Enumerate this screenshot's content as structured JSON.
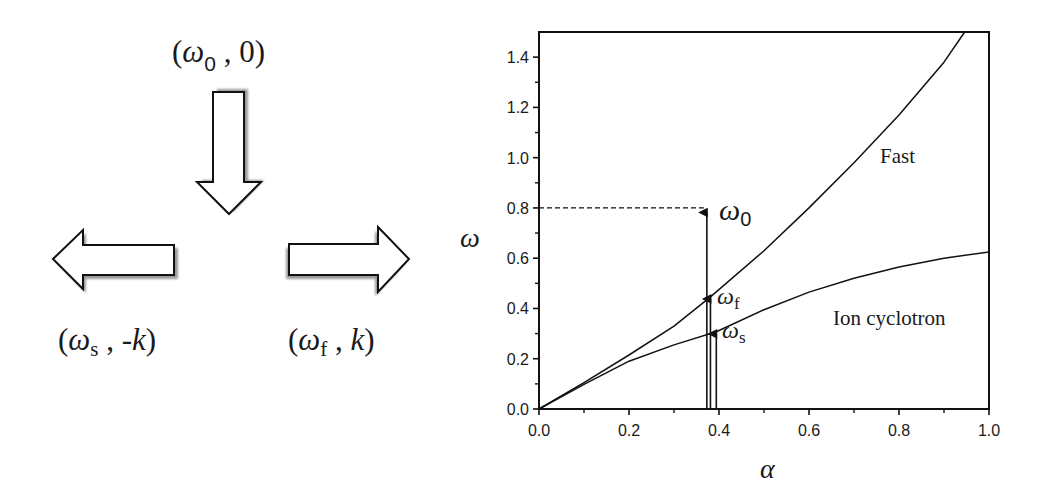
{
  "left_panel": {
    "top_label": {
      "open": "(",
      "omega": "ω",
      "sub": "0",
      "rest": " , 0)"
    },
    "left_label": {
      "open": "(",
      "omega": "ω",
      "sub": "s",
      "sep": " , -",
      "k": "k",
      "close": ")"
    },
    "right_label": {
      "open": "(",
      "omega": "ω",
      "sub": "f",
      "sep": " , ",
      "k": "k",
      "close": ")"
    },
    "arrows": [
      {
        "name": "incident-wave-arrow",
        "direction": "down"
      },
      {
        "name": "slow-wave-arrow",
        "direction": "left"
      },
      {
        "name": "fast-wave-arrow",
        "direction": "right"
      }
    ]
  },
  "chart_data": {
    "type": "line",
    "title": "",
    "xlabel": "α",
    "ylabel": "ω",
    "xlim": [
      0.0,
      1.0
    ],
    "ylim": [
      0.0,
      1.5
    ],
    "grid": false,
    "x_ticks": [
      "0.0",
      "0.2",
      "0.4",
      "0.6",
      "0.8",
      "1.0"
    ],
    "y_ticks": [
      "0.0",
      "0.2",
      "0.4",
      "0.6",
      "0.8",
      "1.0",
      "1.2",
      "1.4"
    ],
    "series": [
      {
        "name": "Fast",
        "x": [
          0.0,
          0.1,
          0.2,
          0.3,
          0.381,
          0.5,
          0.6,
          0.7,
          0.8,
          0.9,
          0.946
        ],
        "y": [
          0.0,
          0.105,
          0.215,
          0.33,
          0.446,
          0.63,
          0.8,
          0.98,
          1.17,
          1.38,
          1.5
        ]
      },
      {
        "name": "Ion cyclotron",
        "x": [
          0.0,
          0.1,
          0.2,
          0.3,
          0.394,
          0.5,
          0.6,
          0.7,
          0.8,
          0.9,
          1.0
        ],
        "y": [
          0.0,
          0.098,
          0.19,
          0.255,
          0.307,
          0.395,
          0.465,
          0.52,
          0.565,
          0.6,
          0.625
        ]
      }
    ],
    "annotations": [
      {
        "text": "Fast",
        "x": 0.87,
        "y": 1.0
      },
      {
        "text": "Ion cyclotron",
        "x": 0.83,
        "y": 0.33
      },
      {
        "text": "ω",
        "sub": "0",
        "x": 0.4,
        "y": 0.8,
        "arrow_from": [
          0.373,
          0.0
        ],
        "arrow_to": [
          0.373,
          0.79
        ],
        "dashed_to_axis": true
      },
      {
        "text": "ω",
        "sub": "f",
        "x": 0.4,
        "y": 0.44,
        "arrow_from": [
          0.381,
          0.0
        ],
        "arrow_to": [
          0.381,
          0.446
        ]
      },
      {
        "text": "ω",
        "sub": "s",
        "x": 0.405,
        "y": 0.3,
        "arrow_from": [
          0.394,
          0.0
        ],
        "arrow_to": [
          0.394,
          0.307
        ]
      }
    ],
    "labels": {
      "fast": "Fast",
      "ion": "Ion cyclotron",
      "omega": "ω",
      "sub0": "0",
      "subf": "f",
      "subs": "s"
    }
  }
}
